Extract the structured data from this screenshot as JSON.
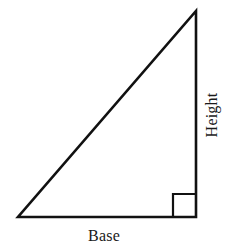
{
  "figure": {
    "type": "right-triangle-diagram",
    "background_color": "#ffffff",
    "stroke_color": "#111111",
    "labels": {
      "base": "Base",
      "height": "Height"
    },
    "geometry": {
      "apex": [
        196,
        11
      ],
      "bottom_left": [
        18,
        217
      ],
      "bottom_right": [
        196,
        217
      ],
      "right_angle_marker": {
        "corner": [
          196,
          217
        ],
        "size": 23
      },
      "stroke_width": 2.6
    },
    "height_label_rotation_deg": -90
  }
}
